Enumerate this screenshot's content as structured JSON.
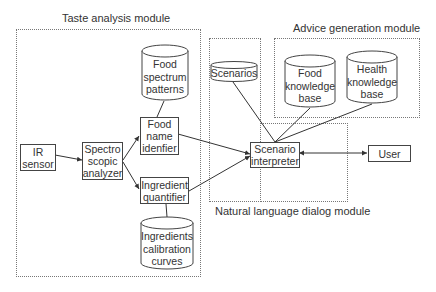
{
  "modules": {
    "taste": {
      "title": "Taste analysis module"
    },
    "advice": {
      "title": "Advice generation module"
    },
    "dialog": {
      "title": "Natural language dialog module"
    }
  },
  "nodes": {
    "ir_sensor": {
      "lines": [
        "IR",
        "sensor"
      ],
      "shape": "box"
    },
    "spectro": {
      "lines": [
        "Spectro",
        "scopic",
        "analyzer"
      ],
      "shape": "box"
    },
    "food_spectrum": {
      "lines": [
        "Food",
        "spectrum",
        "patterns"
      ],
      "shape": "cylinder"
    },
    "food_name": {
      "lines": [
        "Food",
        "name",
        "idenfier"
      ],
      "shape": "box"
    },
    "ingredient_quantifier": {
      "lines": [
        "Ingredient",
        "quantifier"
      ],
      "shape": "box"
    },
    "ingredients_calibration": {
      "lines": [
        "Ingredients",
        "calibration",
        "curves"
      ],
      "shape": "cylinder"
    },
    "scenarios": {
      "lines": [
        "Scenarios"
      ],
      "shape": "cylinder"
    },
    "food_kb": {
      "lines": [
        "Food",
        "knowledge",
        "base"
      ],
      "shape": "cylinder"
    },
    "health_kb": {
      "lines": [
        "Health",
        "knowledge",
        "base"
      ],
      "shape": "cylinder"
    },
    "scenario_interpreter": {
      "lines": [
        "Scenario",
        "interpreter"
      ],
      "shape": "box"
    },
    "user": {
      "lines": [
        "User"
      ],
      "shape": "box"
    }
  },
  "edges": [
    {
      "from": "IR sensor",
      "to": "Spectroscopic analyzer",
      "arrow": "end"
    },
    {
      "from": "Spectroscopic analyzer",
      "to": "Food name idenfier",
      "arrow": "end"
    },
    {
      "from": "Spectroscopic analyzer",
      "to": "Ingredient quantifier",
      "arrow": "end"
    },
    {
      "from": "Food spectrum patterns",
      "to": "Food name idenfier",
      "arrow": "none"
    },
    {
      "from": "Ingredients calibration curves",
      "to": "Ingredient quantifier",
      "arrow": "none"
    },
    {
      "from": "Food name idenfier",
      "to": "Scenario interpreter",
      "arrow": "end"
    },
    {
      "from": "Ingredient quantifier",
      "to": "Scenario interpreter",
      "arrow": "end"
    },
    {
      "from": "Scenarios",
      "to": "Scenario interpreter",
      "arrow": "none"
    },
    {
      "from": "Food knowledge base",
      "to": "Scenario interpreter",
      "arrow": "none"
    },
    {
      "from": "Health knowledge base",
      "to": "Scenario interpreter",
      "arrow": "none"
    },
    {
      "from": "Scenario interpreter",
      "to": "User",
      "arrow": "both"
    }
  ]
}
